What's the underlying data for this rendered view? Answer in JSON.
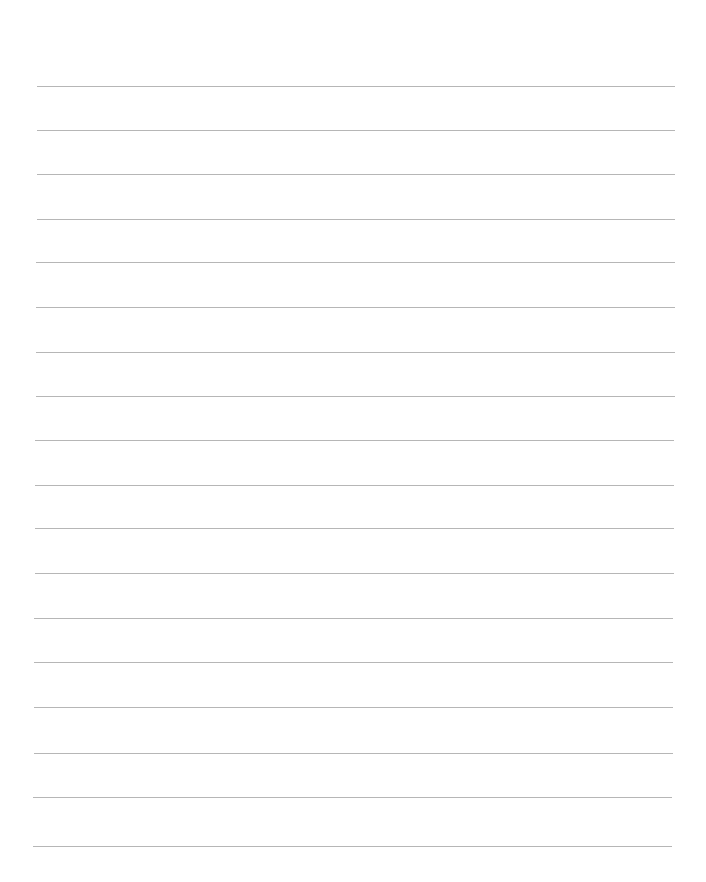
{
  "page": {
    "type": "ruled-paper",
    "background_color": "#ffffff",
    "line_color": "#a9a9a9",
    "line_count": 18,
    "lines": [
      {
        "y": 86,
        "x1": 37,
        "x2": 675
      },
      {
        "y": 130,
        "x1": 37,
        "x2": 675
      },
      {
        "y": 174,
        "x1": 37,
        "x2": 675
      },
      {
        "y": 219,
        "x1": 37,
        "x2": 675
      },
      {
        "y": 262,
        "x1": 36,
        "x2": 675
      },
      {
        "y": 307,
        "x1": 36,
        "x2": 675
      },
      {
        "y": 352,
        "x1": 36,
        "x2": 675
      },
      {
        "y": 396,
        "x1": 36,
        "x2": 675
      },
      {
        "y": 440,
        "x1": 35,
        "x2": 674
      },
      {
        "y": 485,
        "x1": 35,
        "x2": 674
      },
      {
        "y": 528,
        "x1": 35,
        "x2": 674
      },
      {
        "y": 573,
        "x1": 35,
        "x2": 674
      },
      {
        "y": 618,
        "x1": 34,
        "x2": 673
      },
      {
        "y": 662,
        "x1": 34,
        "x2": 673
      },
      {
        "y": 707,
        "x1": 34,
        "x2": 673
      },
      {
        "y": 753,
        "x1": 34,
        "x2": 673
      },
      {
        "y": 797,
        "x1": 33,
        "x2": 672
      },
      {
        "y": 846,
        "x1": 33,
        "x2": 672
      }
    ]
  }
}
